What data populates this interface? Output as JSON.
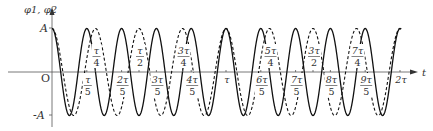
{
  "chart_data": {
    "type": "line",
    "title": "",
    "ylabel": "φ1, φ2",
    "xlabel": "t",
    "origin_label": "O",
    "y_ticks": [
      {
        "label": "A",
        "value": 1
      },
      {
        "label": "-A",
        "value": -1
      }
    ],
    "x_range": [
      0,
      2.0
    ],
    "x_unit": "τ",
    "x_ticks_below": [
      {
        "value": 0.2,
        "num": "τ",
        "den": "5"
      },
      {
        "value": 0.4,
        "num": "2τ",
        "den": "5"
      },
      {
        "value": 0.6,
        "num": "3τ",
        "den": "5"
      },
      {
        "value": 0.8,
        "num": "4τ",
        "den": "5"
      },
      {
        "value": 1.0,
        "num": "τ",
        "den": ""
      },
      {
        "value": 1.2,
        "num": "6τ",
        "den": "5"
      },
      {
        "value": 1.4,
        "num": "7τ",
        "den": "5"
      },
      {
        "value": 1.6,
        "num": "8τ",
        "den": "5"
      },
      {
        "value": 1.8,
        "num": "9τ",
        "den": "5"
      },
      {
        "value": 2.0,
        "num": "2τ",
        "den": ""
      }
    ],
    "x_ticks_above": [
      {
        "value": 0.25,
        "num": "τ",
        "den": "4"
      },
      {
        "value": 0.5,
        "num": "τ",
        "den": "2"
      },
      {
        "value": 0.75,
        "num": "3τ",
        "den": "4"
      },
      {
        "value": 1.25,
        "num": "5τ",
        "den": "4"
      },
      {
        "value": 1.5,
        "num": "3τ",
        "den": "2"
      },
      {
        "value": 1.75,
        "num": "7τ",
        "den": "4"
      }
    ],
    "series": [
      {
        "name": "φ1",
        "style": "solid",
        "amplitude": 1,
        "period": 0.2,
        "formula": "A cos(2π t / (τ/5))"
      },
      {
        "name": "φ2",
        "style": "dashed",
        "amplitude": 1,
        "period": 0.25,
        "formula": "A cos(2π t / (τ/4))"
      }
    ],
    "ylim": [
      -1,
      1
    ],
    "grid": false,
    "legend": "none"
  }
}
